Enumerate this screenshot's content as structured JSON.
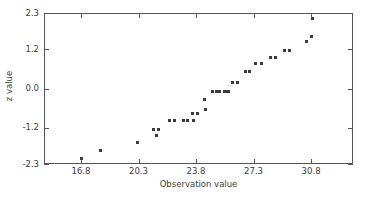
{
  "chart_data": {
    "type": "scatter",
    "title": "",
    "xlabel": "Observation value",
    "ylabel": "z value",
    "xlim": [
      14.55,
      33.35
    ],
    "ylim": [
      -2.3,
      2.3
    ],
    "grid": false,
    "legend": null,
    "marker": "filled-square",
    "marker_color": "#3a3a3a",
    "xticks": [
      16.8,
      20.3,
      23.8,
      27.3,
      30.8
    ],
    "xtick_labels": [
      "16.8",
      "20.3",
      "23.8",
      "27.3",
      "30.8"
    ],
    "yticks": [
      -2.3,
      -1.2,
      0.0,
      1.2,
      2.3
    ],
    "ytick_labels": [
      "-2.3",
      "-1.2",
      "0.0",
      "1.2",
      "2.3"
    ],
    "x": [
      16.8,
      17.9,
      20.1,
      21.1,
      21.2,
      21.3,
      22.1,
      22.2,
      22.9,
      23.0,
      23.6,
      23.7,
      24.1,
      24.2,
      24.5,
      24.6,
      25.0,
      25.1,
      25.3,
      25.4,
      25.8,
      26.0,
      26.2,
      26.8,
      26.9,
      27.4,
      27.5,
      28.2,
      28.3,
      28.6,
      28.7,
      29.3,
      29.6,
      29.7,
      30.6,
      30.8,
      30.9
    ],
    "y": [
      -2.1,
      -1.85,
      -1.6,
      -1.22,
      -1.22,
      -1.38,
      -0.95,
      -0.95,
      -0.95,
      -0.95,
      -0.95,
      -0.72,
      -0.72,
      -0.3,
      -0.62,
      -0.05,
      -0.05,
      -0.05,
      -0.05,
      -0.05,
      -0.05,
      0.22,
      0.22,
      0.55,
      0.55,
      0.8,
      0.8,
      0.98,
      0.98,
      1.2,
      1.2,
      1.45,
      1.6,
      1.6,
      2.1,
      2.1,
      2.1
    ],
    "points": [
      {
        "x": 16.8,
        "y": -2.1
      },
      {
        "x": 17.9,
        "y": -1.85
      },
      {
        "x": 20.15,
        "y": -1.6
      },
      {
        "x": 21.15,
        "y": -1.22
      },
      {
        "x": 21.45,
        "y": -1.22
      },
      {
        "x": 21.35,
        "y": -1.4
      },
      {
        "x": 22.15,
        "y": -0.95
      },
      {
        "x": 22.45,
        "y": -0.95
      },
      {
        "x": 22.95,
        "y": -0.95
      },
      {
        "x": 23.25,
        "y": -0.95
      },
      {
        "x": 23.6,
        "y": -0.95
      },
      {
        "x": 23.55,
        "y": -0.72
      },
      {
        "x": 23.85,
        "y": -0.72
      },
      {
        "x": 24.25,
        "y": -0.3
      },
      {
        "x": 24.3,
        "y": -0.62
      },
      {
        "x": 24.75,
        "y": -0.05
      },
      {
        "x": 25.0,
        "y": -0.05
      },
      {
        "x": 25.45,
        "y": -0.05
      },
      {
        "x": 25.7,
        "y": -0.05
      },
      {
        "x": 25.15,
        "y": -0.05
      },
      {
        "x": 25.55,
        "y": -0.05
      },
      {
        "x": 25.95,
        "y": 0.22
      },
      {
        "x": 26.25,
        "y": 0.22
      },
      {
        "x": 26.75,
        "y": 0.55
      },
      {
        "x": 27.0,
        "y": 0.55
      },
      {
        "x": 27.35,
        "y": 0.8
      },
      {
        "x": 27.7,
        "y": 0.8
      },
      {
        "x": 28.25,
        "y": 0.98
      },
      {
        "x": 28.55,
        "y": 0.98
      },
      {
        "x": 29.15,
        "y": 1.2
      },
      {
        "x": 29.45,
        "y": 1.2
      },
      {
        "x": 30.45,
        "y": 1.45
      },
      {
        "x": 30.75,
        "y": 1.6
      },
      {
        "x": 30.85,
        "y": 2.15
      }
    ]
  },
  "axes": {
    "x_title": "Observation value",
    "y_title": "z value",
    "x_tick_labels": [
      "16.8",
      "20.3",
      "23.8",
      "27.3",
      "30.8"
    ],
    "y_tick_labels": [
      "2.3",
      "1.2",
      "0.0",
      "-1.2",
      "-2.3"
    ]
  },
  "colors": {
    "frame": "#555555",
    "text": "#3c3c3c",
    "marker": "#3a3a3a",
    "background": "#ffffff"
  }
}
